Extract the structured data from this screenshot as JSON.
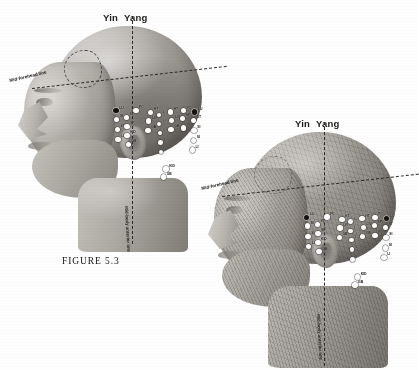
{
  "figure": {
    "caption": "FIGURE 5.3",
    "background_color": "#ffffff",
    "ink_color": "#1a1816",
    "point_fill_color": "#ffffff",
    "point_marked_color": "#14120f"
  },
  "axis_labels": {
    "yin": "Yin",
    "yang": "Yang"
  },
  "annotations": {
    "mid_forehead_line": "Mid-forehead line",
    "mid_body_line": "Mid-body anterior line"
  },
  "diagrams": [
    {
      "id": "surface-head",
      "view": "left lateral head, surface anatomy",
      "yin_label": "Yin",
      "yang_label": "Yang",
      "mid_forehead_label": "Mid-forehead line",
      "mid_body_label": "Mid-body anterior line",
      "points": [
        {
          "label": "LU",
          "x": 36.0,
          "y": 40.0,
          "marked": true
        },
        {
          "label": "PC",
          "x": 51.5,
          "y": 39.5,
          "marked": false
        },
        {
          "label": "ST",
          "x": 44.0,
          "y": 46.0,
          "marked": false
        },
        {
          "label": "SI",
          "x": 36.5,
          "y": 47.5,
          "marked": false
        },
        {
          "label": "SP",
          "x": 44.5,
          "y": 54.0,
          "marked": false
        },
        {
          "label": "SI",
          "x": 37.0,
          "y": 56.5,
          "marked": false
        },
        {
          "label": "KID",
          "x": 44.5,
          "y": 62.0,
          "marked": false
        },
        {
          "label": "LI",
          "x": 37.5,
          "y": 65.5,
          "marked": false
        },
        {
          "label": "GB",
          "x": 45.5,
          "y": 70.0,
          "marked": false
        },
        {
          "label": "HT",
          "x": 63.0,
          "y": 41.5,
          "marked": false
        },
        {
          "label": "LIV",
          "x": 61.5,
          "y": 49.0,
          "marked": false
        },
        {
          "label": "GB",
          "x": 61.0,
          "y": 57.5,
          "marked": false
        },
        {
          "label": "L",
          "x": 70.0,
          "y": 44.0,
          "marked": false
        },
        {
          "label": "I",
          "x": 70.0,
          "y": 52.0,
          "marked": false
        },
        {
          "label": "I",
          "x": 70.5,
          "y": 60.0,
          "marked": false
        },
        {
          "label": "L",
          "x": 71.0,
          "y": 68.5,
          "marked": false
        },
        {
          "label": "I",
          "x": 71.5,
          "y": 77.0,
          "marked": false
        },
        {
          "label": "HT",
          "x": 78.5,
          "y": 41.0,
          "marked": false
        },
        {
          "label": "LIV",
          "x": 79.5,
          "y": 48.5,
          "marked": false
        },
        {
          "label": "GB",
          "x": 79.0,
          "y": 56.5,
          "marked": false
        },
        {
          "label": "PC",
          "x": 88.5,
          "y": 40.0,
          "marked": false
        },
        {
          "label": "SP",
          "x": 88.0,
          "y": 47.0,
          "marked": false
        },
        {
          "label": "PI",
          "x": 88.5,
          "y": 55.5,
          "marked": false
        },
        {
          "label": "LU",
          "x": 97.5,
          "y": 41.0,
          "marked": true
        },
        {
          "label": "ST",
          "x": 96.5,
          "y": 48.5,
          "marked": false
        },
        {
          "label": "SI",
          "x": 97.0,
          "y": 57.5,
          "marked": false
        },
        {
          "label": "SI",
          "x": 96.5,
          "y": 66.5,
          "marked": false
        },
        {
          "label": "LI",
          "x": 95.5,
          "y": 75.0,
          "marked": false
        },
        {
          "label": "KID",
          "x": 75.0,
          "y": 92.0,
          "marked": false
        },
        {
          "label": "GB",
          "x": 73.0,
          "y": 99.0,
          "marked": false
        }
      ]
    },
    {
      "id": "muscle-head",
      "view": "left lateral head, muscular anatomy",
      "yin_label": "Yin",
      "yang_label": "Yang",
      "mid_forehead_label": "Mid-forehead line",
      "mid_body_label": "Mid-body anterior line",
      "points": [
        {
          "label": "LU",
          "x": 36.0,
          "y": 40.0,
          "marked": true
        },
        {
          "label": "PC",
          "x": 51.5,
          "y": 39.5,
          "marked": false
        },
        {
          "label": "ST",
          "x": 44.0,
          "y": 46.0,
          "marked": false
        },
        {
          "label": "SI",
          "x": 36.5,
          "y": 47.5,
          "marked": false
        },
        {
          "label": "SP",
          "x": 44.5,
          "y": 54.0,
          "marked": false
        },
        {
          "label": "SI",
          "x": 37.0,
          "y": 56.5,
          "marked": false
        },
        {
          "label": "KID",
          "x": 44.5,
          "y": 62.0,
          "marked": false
        },
        {
          "label": "LI",
          "x": 37.5,
          "y": 65.5,
          "marked": false
        },
        {
          "label": "GB",
          "x": 45.5,
          "y": 70.0,
          "marked": false
        },
        {
          "label": "HT",
          "x": 63.0,
          "y": 41.5,
          "marked": false
        },
        {
          "label": "LIV",
          "x": 61.5,
          "y": 49.0,
          "marked": false
        },
        {
          "label": "GB",
          "x": 61.0,
          "y": 57.5,
          "marked": false
        },
        {
          "label": "L",
          "x": 70.0,
          "y": 44.0,
          "marked": false
        },
        {
          "label": "I",
          "x": 70.0,
          "y": 52.0,
          "marked": false
        },
        {
          "label": "I",
          "x": 70.5,
          "y": 60.0,
          "marked": false
        },
        {
          "label": "L",
          "x": 71.0,
          "y": 68.5,
          "marked": false
        },
        {
          "label": "I",
          "x": 71.5,
          "y": 77.0,
          "marked": false
        },
        {
          "label": "HT",
          "x": 78.5,
          "y": 41.0,
          "marked": false
        },
        {
          "label": "LIV",
          "x": 79.5,
          "y": 48.5,
          "marked": false
        },
        {
          "label": "GB",
          "x": 79.0,
          "y": 56.5,
          "marked": false
        },
        {
          "label": "PC",
          "x": 88.5,
          "y": 40.0,
          "marked": false
        },
        {
          "label": "SP",
          "x": 88.0,
          "y": 47.0,
          "marked": false
        },
        {
          "label": "PI",
          "x": 88.5,
          "y": 55.5,
          "marked": false
        },
        {
          "label": "LU",
          "x": 97.5,
          "y": 41.0,
          "marked": true
        },
        {
          "label": "ST",
          "x": 96.5,
          "y": 48.5,
          "marked": false
        },
        {
          "label": "SI",
          "x": 97.0,
          "y": 57.5,
          "marked": false
        },
        {
          "label": "SI",
          "x": 96.5,
          "y": 66.5,
          "marked": false
        },
        {
          "label": "LI",
          "x": 95.5,
          "y": 75.0,
          "marked": false
        },
        {
          "label": "KID",
          "x": 75.0,
          "y": 92.0,
          "marked": false
        },
        {
          "label": "GB",
          "x": 73.0,
          "y": 99.0,
          "marked": false
        }
      ]
    }
  ]
}
